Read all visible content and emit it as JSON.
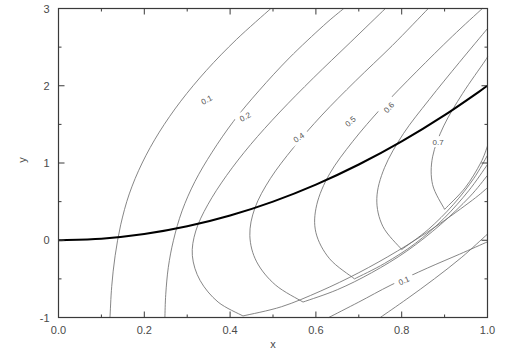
{
  "chart_data": {
    "type": "line",
    "subtype": "contour",
    "title": "",
    "xlabel": "x",
    "ylabel": "y",
    "xlim": [
      0.0,
      1.0
    ],
    "ylim": [
      -1,
      3
    ],
    "grid": false,
    "legend": null,
    "xticks": [
      0.0,
      0.2,
      0.4,
      0.6,
      0.8,
      1.0
    ],
    "xticklabels": [
      "0.0",
      "0.2",
      "0.4",
      "0.6",
      "0.8",
      "1.0"
    ],
    "xminorticks": [
      0.1,
      0.3,
      0.5,
      0.7,
      0.9
    ],
    "yticks": [
      -1,
      0,
      1,
      2,
      3
    ],
    "yticklabels": [
      "-1",
      "0",
      "1",
      "2",
      "3"
    ],
    "yminorticks": [
      -0.5,
      0.5,
      1.5,
      2.5
    ],
    "levels": [
      0.1,
      0.2,
      0.3,
      0.4,
      0.5,
      0.6,
      0.7
    ],
    "contour_labels": [
      {
        "level": "0.1",
        "x": 0.345,
        "y": 1.82,
        "rotation": -28
      },
      {
        "level": "0.2",
        "x": 0.435,
        "y": 1.6,
        "rotation": -28
      },
      {
        "level": "0.4",
        "x": 0.56,
        "y": 1.33,
        "rotation": -34
      },
      {
        "level": "0.5",
        "x": 0.68,
        "y": 1.54,
        "rotation": -40
      },
      {
        "level": "0.6",
        "x": 0.77,
        "y": 1.72,
        "rotation": -48
      },
      {
        "level": "0.7",
        "x": 0.885,
        "y": 1.27,
        "rotation": 0
      },
      {
        "level": "0.1",
        "x": 0.805,
        "y": -0.52,
        "rotation": -24
      }
    ],
    "ridge_curve": {
      "description": "bold curve through contour apexes",
      "points": [
        [
          0.0,
          0.0
        ],
        [
          0.1,
          0.02
        ],
        [
          0.2,
          0.08
        ],
        [
          0.3,
          0.18
        ],
        [
          0.4,
          0.32
        ],
        [
          0.5,
          0.5
        ],
        [
          0.6,
          0.72
        ],
        [
          0.7,
          0.98
        ],
        [
          0.8,
          1.28
        ],
        [
          0.9,
          1.62
        ],
        [
          1.0,
          2.0
        ]
      ]
    },
    "series": [
      {
        "name": "0.1",
        "points": [
          [
            0.12,
            -1.0
          ],
          [
            0.124,
            -0.6
          ],
          [
            0.132,
            -0.2
          ],
          [
            0.145,
            0.2
          ],
          [
            0.165,
            0.6
          ],
          [
            0.195,
            1.0
          ],
          [
            0.235,
            1.4
          ],
          [
            0.285,
            1.8
          ],
          [
            0.345,
            2.2
          ],
          [
            0.415,
            2.6
          ],
          [
            0.495,
            3.0
          ]
        ]
      },
      {
        "name": "0.1b",
        "points": [
          [
            0.63,
            -1.0
          ],
          [
            0.7,
            -0.8
          ],
          [
            0.775,
            -0.58
          ],
          [
            0.86,
            -0.36
          ],
          [
            0.935,
            -0.18
          ],
          [
            1.0,
            -0.02
          ]
        ]
      },
      {
        "name": "0.2",
        "points": [
          [
            0.248,
            -1.0
          ],
          [
            0.25,
            -0.7
          ],
          [
            0.256,
            -0.35
          ],
          [
            0.268,
            0.0
          ],
          [
            0.288,
            0.38
          ],
          [
            0.318,
            0.76
          ],
          [
            0.358,
            1.14
          ],
          [
            0.408,
            1.54
          ],
          [
            0.468,
            1.94
          ],
          [
            0.538,
            2.36
          ],
          [
            0.618,
            2.78
          ],
          [
            0.665,
            3.0
          ]
        ]
      },
      {
        "name": "0.2b",
        "points": [
          [
            0.75,
            -1.0
          ],
          [
            0.812,
            -0.76
          ],
          [
            0.876,
            -0.5
          ],
          [
            0.94,
            -0.22
          ],
          [
            1.0,
            0.08
          ]
        ]
      },
      {
        "name": "0.3",
        "points": [
          [
            0.43,
            -0.98
          ],
          [
            0.372,
            -0.8
          ],
          [
            0.33,
            -0.52
          ],
          [
            0.312,
            -0.2
          ],
          [
            0.32,
            0.12
          ],
          [
            0.348,
            0.46
          ],
          [
            0.392,
            0.84
          ],
          [
            0.448,
            1.24
          ],
          [
            0.516,
            1.66
          ],
          [
            0.594,
            2.1
          ],
          [
            0.68,
            2.56
          ],
          [
            0.762,
            3.0
          ]
        ]
      },
      {
        "name": "0.3b",
        "points": [
          [
            0.43,
            -0.98
          ],
          [
            0.52,
            -0.86
          ],
          [
            0.61,
            -0.66
          ],
          [
            0.7,
            -0.42
          ],
          [
            0.79,
            -0.14
          ],
          [
            0.88,
            0.18
          ],
          [
            0.965,
            0.52
          ],
          [
            1.0,
            0.68
          ]
        ]
      },
      {
        "name": "0.4",
        "points": [
          [
            0.57,
            -0.8
          ],
          [
            0.506,
            -0.58
          ],
          [
            0.462,
            -0.28
          ],
          [
            0.446,
            0.06
          ],
          [
            0.458,
            0.42
          ],
          [
            0.494,
            0.8
          ],
          [
            0.548,
            1.2
          ],
          [
            0.614,
            1.62
          ],
          [
            0.692,
            2.06
          ],
          [
            0.778,
            2.52
          ],
          [
            0.862,
            3.0
          ]
        ]
      },
      {
        "name": "0.4b",
        "points": [
          [
            0.57,
            -0.8
          ],
          [
            0.65,
            -0.64
          ],
          [
            0.73,
            -0.42
          ],
          [
            0.812,
            -0.14
          ],
          [
            0.89,
            0.2
          ],
          [
            0.958,
            0.56
          ],
          [
            1.0,
            0.84
          ]
        ]
      },
      {
        "name": "0.5",
        "points": [
          [
            0.69,
            -0.5
          ],
          [
            0.632,
            -0.24
          ],
          [
            0.6,
            0.1
          ],
          [
            0.602,
            0.46
          ],
          [
            0.632,
            0.86
          ],
          [
            0.686,
            1.28
          ],
          [
            0.754,
            1.72
          ],
          [
            0.834,
            2.18
          ],
          [
            0.918,
            2.64
          ],
          [
            0.988,
            3.0
          ]
        ]
      },
      {
        "name": "0.5b",
        "points": [
          [
            0.69,
            -0.5
          ],
          [
            0.76,
            -0.3
          ],
          [
            0.832,
            -0.04
          ],
          [
            0.898,
            0.28
          ],
          [
            0.956,
            0.64
          ],
          [
            1.0,
            0.98
          ]
        ]
      },
      {
        "name": "0.6",
        "points": [
          [
            0.8,
            -0.12
          ],
          [
            0.756,
            0.18
          ],
          [
            0.742,
            0.54
          ],
          [
            0.76,
            0.94
          ],
          [
            0.804,
            1.38
          ],
          [
            0.864,
            1.82
          ],
          [
            0.934,
            2.3
          ],
          [
            1.0,
            2.74
          ]
        ]
      },
      {
        "name": "0.6b",
        "points": [
          [
            0.8,
            -0.12
          ],
          [
            0.862,
            0.14
          ],
          [
            0.92,
            0.46
          ],
          [
            0.968,
            0.8
          ],
          [
            1.0,
            1.1
          ]
        ]
      },
      {
        "name": "0.7",
        "points": [
          [
            0.9,
            0.4
          ],
          [
            0.872,
            0.72
          ],
          [
            0.872,
            1.08
          ],
          [
            0.898,
            1.48
          ],
          [
            0.942,
            1.9
          ],
          [
            0.994,
            2.32
          ],
          [
            1.0,
            2.38
          ]
        ]
      },
      {
        "name": "0.7b",
        "points": [
          [
            0.9,
            0.4
          ],
          [
            0.948,
            0.68
          ],
          [
            0.984,
            1.0
          ],
          [
            1.0,
            1.22
          ]
        ]
      }
    ]
  },
  "axes": {
    "x_title": "x",
    "y_title": "y"
  }
}
